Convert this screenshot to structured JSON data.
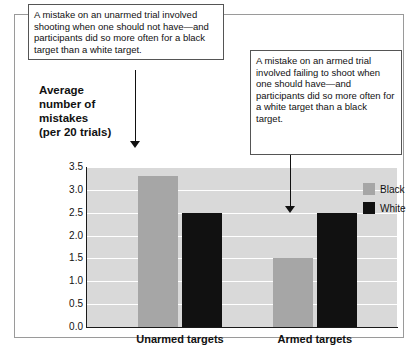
{
  "chart_data": {
    "type": "bar",
    "title": "",
    "ylabel": "Average number of mistakes (per 20 trials)",
    "xlabel": "",
    "categories": [
      "Unarmed targets",
      "Armed targets"
    ],
    "series": [
      {
        "name": "Black",
        "color": "#a6a6a6",
        "values": [
          3.3,
          1.5
        ]
      },
      {
        "name": "White",
        "color": "#111111",
        "values": [
          2.5,
          2.5
        ]
      }
    ],
    "ylim": [
      0.0,
      3.5
    ],
    "yticks": [
      "3.5",
      "3.0",
      "2.5",
      "2.0",
      "1.5",
      "1.0",
      "0.5",
      "0.0"
    ],
    "grid": true,
    "legend_position": "right"
  },
  "axis": {
    "title_line1": "Average",
    "title_line2": "number of",
    "title_line3": "mistakes",
    "title_line4": "(per 20 trials)"
  },
  "legend": {
    "items": [
      {
        "label": "Black",
        "color": "#a6a6a6"
      },
      {
        "label": "White",
        "color": "#111111"
      }
    ]
  },
  "annotations": {
    "left": "A mistake on an unarmed trial involved shooting when one should not have—and participants did so more often for a black target than a white target.",
    "right": "A mistake on an armed trial involved failing to shoot when one should have—and participants did so more often for a white target than a black target."
  }
}
